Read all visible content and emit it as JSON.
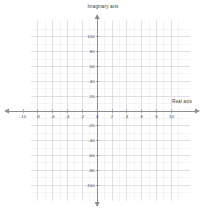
{
  "chart_data": {
    "type": "scatter",
    "title": "",
    "xlabel": "Real axis",
    "ylabel": "Imaginary axis",
    "xlim": [
      -11.5,
      11.5
    ],
    "ylim": [
      -115,
      115
    ],
    "xticks": [
      -10,
      -8,
      -6,
      -4,
      -2,
      0,
      2,
      4,
      6,
      8,
      10
    ],
    "xtick_labels": [
      "-10",
      "-8",
      "-6",
      "-4",
      "-2",
      "0",
      "2",
      "4",
      "6",
      "8",
      "10"
    ],
    "yticks": [
      -100,
      -80,
      -60,
      -40,
      -20,
      20,
      40,
      60,
      80,
      100
    ],
    "ytick_labels": [
      "-100",
      "-80",
      "-60",
      "-40",
      "-20",
      "20",
      "40",
      "60",
      "80",
      "100"
    ],
    "x_major_step": 2,
    "x_minor_step": 1,
    "y_major_step": 20,
    "y_minor_step": 10,
    "grid": true,
    "legend": null,
    "series": [],
    "values": [],
    "categories": [],
    "annotations": [],
    "axis_arrows": [
      "left",
      "right",
      "up",
      "down"
    ],
    "colors": {
      "grid_minor": "#e3e3e6",
      "grid_major": "#c9c9cf",
      "axis": "#8d8d96",
      "text": "#4a4a4a",
      "background": "#ffffff"
    }
  },
  "labels": {
    "imaginary_axis": "Imaginary axis",
    "real_axis": "Real axis"
  }
}
